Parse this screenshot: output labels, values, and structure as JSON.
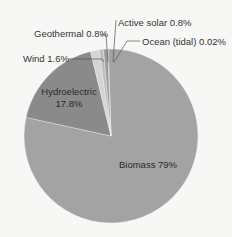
{
  "chart_data": {
    "type": "pie",
    "title": "",
    "categories": [
      "Biomass",
      "Hydroelectric",
      "Wind",
      "Geothermal",
      "Active solar",
      "Ocean (tidal)"
    ],
    "values": [
      79,
      17.8,
      1.6,
      0.8,
      0.8,
      0.02
    ],
    "unit": "%",
    "labels": [
      "Biomass 79%",
      "Hydroelectric 17.8%",
      "Wind 1.6%",
      "Geothermal 0.8%",
      "Active solar 0.8%",
      "Ocean (tidal) 0.02%"
    ],
    "colors": [
      "#a3a3a3",
      "#8a8a8a",
      "#d4d4d4",
      "#bcbcbc",
      "#9a9a9a",
      "#7a7a7a"
    ],
    "legend": "none",
    "label_position": "callouts for small slices, inside for large slices"
  },
  "labels": {
    "biomass": "Biomass 79%",
    "hydro_name": "Hydroelectric",
    "hydro_value": "17.8%",
    "wind": "Wind 1.6%",
    "geothermal": "Geothermal 0.8%",
    "active_solar": "Active solar 0.8%",
    "ocean": "Ocean (tidal) 0.02%"
  }
}
